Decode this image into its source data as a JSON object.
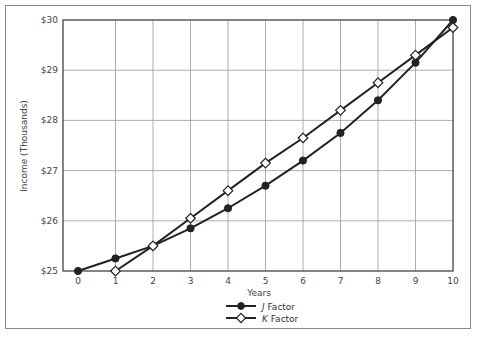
{
  "chart_data": {
    "type": "line",
    "title": "",
    "xlabel": "Years",
    "ylabel": "Income (Thousands)",
    "x": [
      0,
      1,
      2,
      3,
      4,
      5,
      6,
      7,
      8,
      9,
      10
    ],
    "xlim": [
      0,
      10
    ],
    "ylim": [
      25,
      30
    ],
    "y_ticks": [
      "$25",
      "$26",
      "$27",
      "$28",
      "$29",
      "$30"
    ],
    "x_ticks": [
      "0",
      "1",
      "2",
      "3",
      "4",
      "5",
      "6",
      "7",
      "8",
      "9",
      "10"
    ],
    "grid": true,
    "legend_position": "bottom-center",
    "series": [
      {
        "name": "J Factor",
        "name_italic_part": "J",
        "name_rest": " Factor",
        "marker": "filled-circle",
        "color": "#222222",
        "x": [
          0,
          1,
          2,
          3,
          4,
          5,
          6,
          7,
          8,
          9,
          10
        ],
        "values": [
          25.0,
          25.25,
          25.5,
          25.85,
          26.25,
          26.7,
          27.2,
          27.75,
          28.4,
          29.15,
          30.0
        ]
      },
      {
        "name": "K Factor",
        "name_italic_part": "K",
        "name_rest": " Factor",
        "marker": "open-diamond",
        "color": "#222222",
        "x": [
          1,
          2,
          3,
          4,
          5,
          6,
          7,
          8,
          9,
          10
        ],
        "values": [
          25.0,
          25.5,
          26.05,
          26.6,
          27.15,
          27.65,
          28.2,
          28.75,
          29.3,
          29.85
        ]
      }
    ]
  },
  "colors": {
    "grid": "#9a9a9a",
    "axis": "#333333",
    "frame": "#8a8a8a",
    "line": "#222222",
    "text": "#444444"
  }
}
